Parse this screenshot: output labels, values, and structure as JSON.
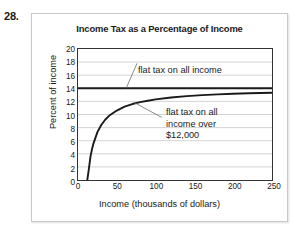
{
  "problem_number": "28.",
  "figure": {
    "title": "Income Tax as a Percentage of Income",
    "x_axis_title": "Income (thousands of dollars)",
    "y_axis_title": "Percent of income"
  },
  "chart_data": {
    "type": "line",
    "title": "Income Tax as a Percentage of Income",
    "xlabel": "Income (thousands of dollars)",
    "ylabel": "Percent of income",
    "xlim": [
      0,
      250
    ],
    "ylim": [
      0,
      20
    ],
    "xticks": [
      0,
      50,
      100,
      150,
      200,
      250
    ],
    "yticks": [
      0,
      2,
      4,
      6,
      8,
      10,
      12,
      14,
      16,
      18,
      20
    ],
    "grid": "horizontal",
    "legend": "none (inline annotations)",
    "series": [
      {
        "name": "flat tax on all income",
        "description": "Constant 14 percent of income at every income level",
        "color": "#1a1a1a",
        "x": [
          0,
          50,
          100,
          150,
          200,
          250
        ],
        "values": [
          14,
          14,
          14,
          14,
          14,
          14
        ]
      },
      {
        "name": "flat tax on all income over $12,000",
        "description": "Percent of income = 14 * (1 - 12 / income); zero at and below $12,000",
        "color": "#1a1a1a",
        "threshold": 12,
        "x": [
          12,
          14,
          16,
          18,
          20,
          25,
          30,
          35,
          40,
          50,
          60,
          70,
          80,
          90,
          100,
          120,
          140,
          160,
          180,
          200,
          220,
          250
        ],
        "values": [
          0,
          1.7,
          3.5,
          4.7,
          5.6,
          7.3,
          8.4,
          9.2,
          9.8,
          10.6,
          11.2,
          11.6,
          11.9,
          12.1,
          12.3,
          12.6,
          12.8,
          12.95,
          13.07,
          13.16,
          13.24,
          13.33
        ]
      }
    ],
    "annotations": [
      {
        "text": "flat tax on all income",
        "points_to_series": "flat tax on all income",
        "points_to": {
          "x": 62,
          "y": 14
        }
      },
      {
        "text": "flat tax on all\nincome over\n$12,000",
        "points_to_series": "flat tax on all income over $12,000",
        "points_to": {
          "x": 72,
          "y": 11.8
        }
      }
    ]
  },
  "y_ticks": [
    {
      "label": "20",
      "value": 20
    },
    {
      "label": "18",
      "value": 18
    },
    {
      "label": "16",
      "value": 16
    },
    {
      "label": "14",
      "value": 14
    },
    {
      "label": "12",
      "value": 12
    },
    {
      "label": "10",
      "value": 10
    },
    {
      "label": "8",
      "value": 8
    },
    {
      "label": "6",
      "value": 6
    },
    {
      "label": "4",
      "value": 4
    },
    {
      "label": "2",
      "value": 2
    },
    {
      "label": "0",
      "value": 0
    }
  ],
  "x_ticks": [
    {
      "label": "0",
      "value": 0
    },
    {
      "label": "50",
      "value": 50
    },
    {
      "label": "100",
      "value": 100
    },
    {
      "label": "150",
      "value": 150
    },
    {
      "label": "200",
      "value": 200
    },
    {
      "label": "250",
      "value": 250
    }
  ],
  "annotations": {
    "flat_all_income": "flat tax on all income",
    "flat_over_threshold": "flat tax on all\nincome over\n$12,000"
  },
  "colors": {
    "curve": "#1a1a1a",
    "gridline": "#c0c0c0",
    "axis": "#333333",
    "frame": "#c8c8c8",
    "background": "#ffffff"
  }
}
